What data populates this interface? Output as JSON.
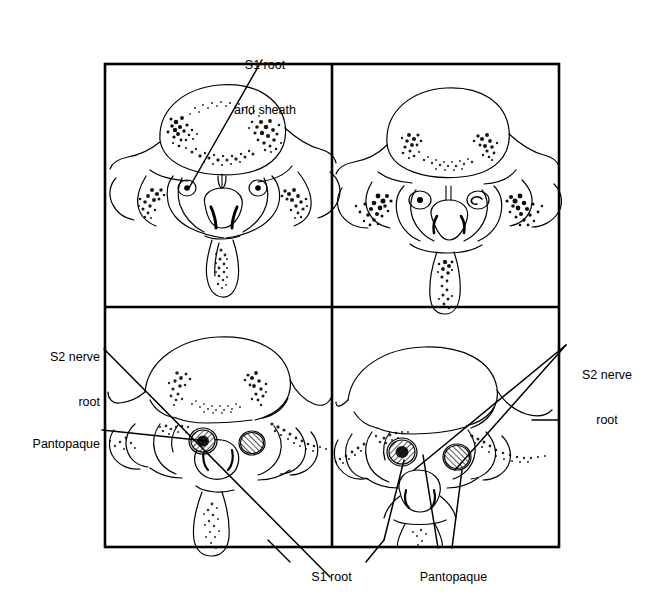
{
  "figure": {
    "panel_count": 4,
    "frame": {
      "x": 105,
      "y": 64,
      "width": 454,
      "height": 483
    },
    "divider_x": 332,
    "divider_y": 307,
    "line_color": "#000000",
    "background_color": "#ffffff"
  },
  "labels": {
    "top": {
      "name": "s1-root-and-sheath",
      "line1": "S1 root",
      "line2": "and sheath"
    },
    "left_upper": {
      "name": "s2-nerve-root-left",
      "line1": "S2 nerve",
      "line2": "root"
    },
    "left_lower": {
      "name": "pantopaque-left",
      "text": "Pantopaque"
    },
    "right": {
      "name": "s2-nerve-root-right",
      "line1": "S2 nerve",
      "line2": "root"
    },
    "bottom_left": {
      "name": "s1-root-bottom",
      "text": "S1 root"
    },
    "bottom_right": {
      "name": "pantopaque-bottom",
      "text": "Pantopaque"
    }
  },
  "panels": [
    {
      "id": "panel-top-left",
      "position": "top-left",
      "description": "Axial vertebral cross-section with stippled oval vertebral body, two small round nerve root sheaths with central dots, central spinal canal and spinous process",
      "features": [
        "vertebral-body",
        "stippled-ring",
        "s1-root-circle-left",
        "s1-root-circle-right",
        "spinal-canal",
        "spinous-process",
        "facet-joints"
      ]
    },
    {
      "id": "panel-top-right",
      "position": "top-right",
      "description": "Lower axial section with crescent stippling in vertebral body, two small oval root structures, dense stippled lateral recesses and elongated spinous process",
      "features": [
        "vertebral-body",
        "crescent-stipple",
        "root-oval-left",
        "root-oval-right",
        "spinal-canal",
        "spinous-process"
      ]
    },
    {
      "id": "panel-bottom-left",
      "position": "bottom-left",
      "description": "Sacral level section with two cross-hatched round nerve root sheaths filled with contrast and a large rounded thecal sac",
      "features": [
        "sacral-body",
        "hatched-root-left",
        "hatched-root-right",
        "thecal-sac",
        "spinous-process"
      ]
    },
    {
      "id": "panel-bottom-right",
      "position": "bottom-right",
      "description": "Lower sacral level section with two cross-hatched contrast-filled nerve root sheaths and a triangular thecal sac",
      "features": [
        "sacral-body",
        "hatched-root-left",
        "hatched-root-right",
        "triangular-thecal-sac",
        "spinous-process"
      ]
    }
  ]
}
